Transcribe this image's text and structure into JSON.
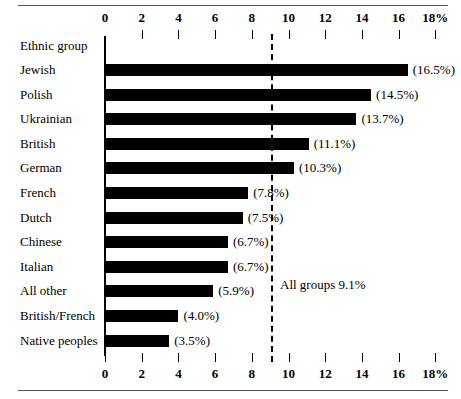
{
  "chart_data": {
    "type": "bar",
    "orientation": "horizontal",
    "title": "",
    "xlabel": "",
    "ylabel": "Ethnic group",
    "xlim": [
      0,
      18
    ],
    "xticks": [
      0,
      2,
      4,
      6,
      8,
      10,
      12,
      14,
      16,
      18
    ],
    "xticklabels": [
      "0",
      "2",
      "4",
      "6",
      "8",
      "10",
      "12",
      "14",
      "16",
      "18%"
    ],
    "grid": false,
    "legend": false,
    "categories": [
      "Jewish",
      "Polish",
      "Ukrainian",
      "British",
      "German",
      "French",
      "Dutch",
      "Chinese",
      "Italian",
      "All other",
      "British/French",
      "Native peoples"
    ],
    "values": [
      16.5,
      14.5,
      13.7,
      11.1,
      10.3,
      7.8,
      7.5,
      6.7,
      6.7,
      5.9,
      4.0,
      3.5
    ],
    "value_labels": [
      "(16.5%)",
      "(14.5%)",
      "(13.7%)",
      "(11.1%)",
      "(10.3%)",
      "(7.8%)",
      "(7.5%)",
      "(6.7%)",
      "(6.7%)",
      "(5.9%)",
      "(4.0%)",
      "(3.5%)"
    ],
    "reference_line": {
      "value": 9.1,
      "label": "All groups 9.1%",
      "style": "dashed"
    },
    "colors": {
      "bar": "#000000",
      "reference_line": "#000000",
      "text": "#000000",
      "rule": "#555555",
      "background": "#ffffff"
    }
  }
}
